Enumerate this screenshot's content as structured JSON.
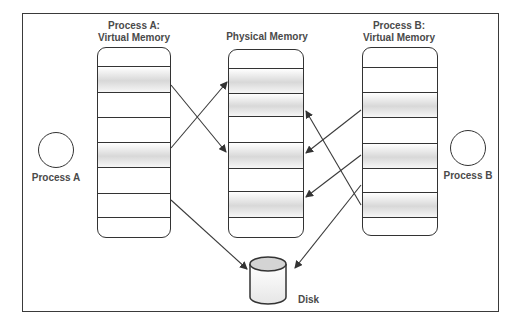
{
  "diagram": {
    "type": "virtual-memory-mapping",
    "process_a": {
      "circle_label": "Process A",
      "title_line1": "Process A:",
      "title_line2": "Virtual Memory",
      "pages": 8,
      "shaded_pages": [
        2,
        5
      ]
    },
    "physical_memory": {
      "title": "Physical Memory",
      "frames": 8,
      "shaded_frames": [
        2,
        3,
        5,
        7
      ]
    },
    "process_b": {
      "circle_label": "Process B",
      "title_line1": "Process B:",
      "title_line2": "Virtual Memory",
      "pages": 8,
      "shaded_pages": [
        3,
        5,
        7
      ]
    },
    "disk": {
      "label": "Disk"
    },
    "mappings": [
      {
        "from": "Process A page 2",
        "to": "Physical frame 5"
      },
      {
        "from": "Process A page 5",
        "to": "Physical frame 2"
      },
      {
        "from": "Process A page 7",
        "to": "Disk"
      },
      {
        "from": "Process B page 3",
        "to": "Physical frame 5"
      },
      {
        "from": "Process B page 5",
        "to": "Physical frame 7"
      },
      {
        "from": "Process B page 7",
        "to": "Physical frame 3"
      },
      {
        "from": "Process B page 6",
        "to": "Disk"
      }
    ],
    "colors": {
      "stroke": "#333333",
      "text": "#4a4a4a",
      "shade": "#d8d8d8",
      "background": "#ffffff"
    }
  }
}
